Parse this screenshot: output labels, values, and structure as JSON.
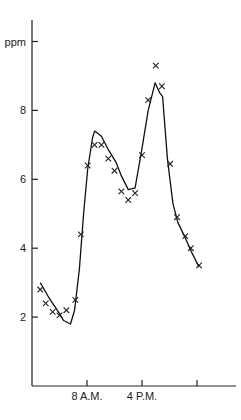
{
  "chart_data": {
    "type": "scatter",
    "title": "",
    "xlabel": "",
    "ylabel": "ppm",
    "xlim": [
      0,
      29.5
    ],
    "ylim": [
      0,
      10
    ],
    "grid": false,
    "legend": "none",
    "y_ticks": [
      {
        "value": 2,
        "label": "2"
      },
      {
        "value": 4,
        "label": "4"
      },
      {
        "value": 6,
        "label": "6"
      },
      {
        "value": 8,
        "label": "8"
      },
      {
        "value": 10,
        "label": "ppm"
      }
    ],
    "x_ticks": [
      {
        "value": 8,
        "label": "8 A.M."
      },
      {
        "value": 16,
        "label": "4 P.M."
      },
      {
        "value": 24,
        "label": ""
      }
    ],
    "series": [
      {
        "name": "observed",
        "kind": "markers",
        "marker": "x",
        "points": [
          [
            1.2,
            2.8
          ],
          [
            2.0,
            2.4
          ],
          [
            3.0,
            2.15
          ],
          [
            4.0,
            2.05
          ],
          [
            5.0,
            2.2
          ],
          [
            6.3,
            2.5
          ],
          [
            7.1,
            4.4
          ],
          [
            8.1,
            6.4
          ],
          [
            9.1,
            7.0
          ],
          [
            10.1,
            7.0
          ],
          [
            11.1,
            6.6
          ],
          [
            12.0,
            6.25
          ],
          [
            13.0,
            5.65
          ],
          [
            14.0,
            5.4
          ],
          [
            15.0,
            5.6
          ],
          [
            16.0,
            6.7
          ],
          [
            16.9,
            8.3
          ],
          [
            18.0,
            9.3
          ],
          [
            18.9,
            8.7
          ],
          [
            20.1,
            6.45
          ],
          [
            21.1,
            4.9
          ],
          [
            22.3,
            4.35
          ],
          [
            23.1,
            4.0
          ],
          [
            24.3,
            3.5
          ]
        ]
      },
      {
        "name": "model",
        "kind": "line",
        "points": [
          [
            1.2,
            3.0
          ],
          [
            2.5,
            2.55
          ],
          [
            4.0,
            2.1
          ],
          [
            4.6,
            1.9
          ],
          [
            5.6,
            1.8
          ],
          [
            6.2,
            2.2
          ],
          [
            6.9,
            3.4
          ],
          [
            7.5,
            5.0
          ],
          [
            8.1,
            6.3
          ],
          [
            8.8,
            7.2
          ],
          [
            9.1,
            7.4
          ],
          [
            10.1,
            7.25
          ],
          [
            11.0,
            6.9
          ],
          [
            12.2,
            6.5
          ],
          [
            13.0,
            6.1
          ],
          [
            14.0,
            5.7
          ],
          [
            15.0,
            5.75
          ],
          [
            16.0,
            6.9
          ],
          [
            16.9,
            8.0
          ],
          [
            17.9,
            8.8
          ],
          [
            18.6,
            8.5
          ],
          [
            19.0,
            8.4
          ],
          [
            19.7,
            6.6
          ],
          [
            20.5,
            5.3
          ],
          [
            21.2,
            4.75
          ],
          [
            22.3,
            4.3
          ],
          [
            23.3,
            3.85
          ],
          [
            24.3,
            3.45
          ]
        ]
      }
    ]
  }
}
